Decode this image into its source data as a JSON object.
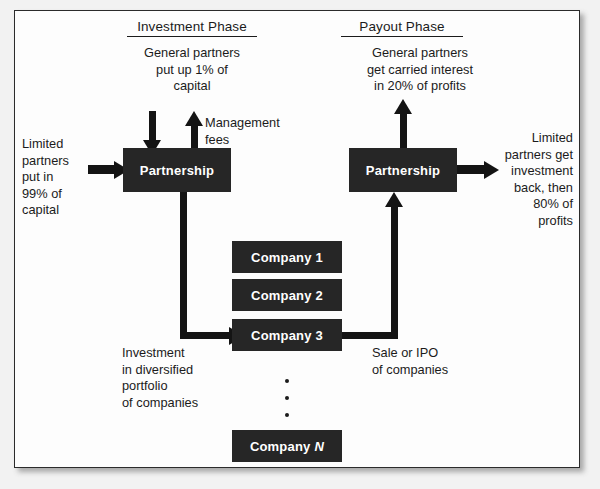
{
  "diagram": {
    "phases": [
      {
        "id": "investment",
        "label": "Investment Phase"
      },
      {
        "id": "payout",
        "label": "Payout Phase"
      }
    ],
    "entities": {
      "partnership_investment": "Partnership",
      "partnership_payout": "Partnership",
      "companies": [
        {
          "label": "Company 1"
        },
        {
          "label": "Company 2"
        },
        {
          "label": "Company 3"
        }
      ],
      "company_n": {
        "prefix": "Company",
        "index": "N"
      }
    },
    "annotations": {
      "gp_contribution": "General partners\nput up 1% of\ncapital",
      "management_fees": "Management\nfees",
      "lp_contribution": "Limited\npartners\nput in\n99% of\ncapital",
      "carried_interest": "General partners\nget carried interest\nin 20% of profits",
      "lp_payout": "Limited\npartners get\ninvestment\nback, then\n80% of\nprofits",
      "investment_flow": "Investment\nin diversified\nportfolio\nof companies",
      "exit_flow": "Sale or IPO\nof companies"
    },
    "ellipsis_dots": 3,
    "colors": {
      "box_fill": "#262626",
      "box_text": "#ffffff",
      "connector": "#141414",
      "page_background": "#f2f2f2",
      "panel_background": "#fdfdfd",
      "panel_border": "#2b2b2b",
      "text": "#1b1b1b"
    }
  }
}
